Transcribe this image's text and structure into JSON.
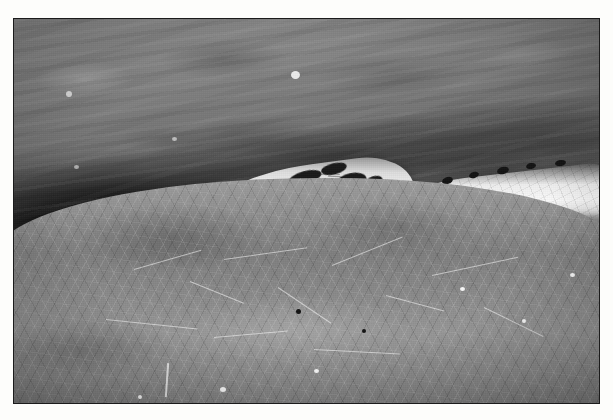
{
  "page": {
    "kind": "photograph",
    "medium": "black-and-white print",
    "background_color": "#ffffff"
  },
  "photo": {
    "title": "Snake head emerging from water",
    "subject": "snake",
    "description": "Close-up black-and-white photograph of a snake's head resting at the surface of water, with algae mat in the foreground",
    "orientation": "landscape",
    "border_color": "#1b1b1b",
    "frame": {
      "left": 13,
      "top": 18,
      "width": 587,
      "height": 386
    },
    "tone_range": {
      "darkest": "#0d0d0d",
      "lightest": "#f7f7f7"
    }
  },
  "scene": {
    "regions": [
      {
        "name": "water-surface",
        "label": "Water surface",
        "tone": "mid gray",
        "color": "#7b7b7b"
      },
      {
        "name": "dark-water",
        "label": "Deep shadow water",
        "tone": "near black",
        "color": "#141414"
      },
      {
        "name": "algae-mat",
        "label": "Algae mat foreground",
        "tone": "light gray",
        "color": "#8f8f8f"
      }
    ],
    "subject_parts": [
      {
        "name": "snake-head",
        "label": "Snake head",
        "tone": "bright",
        "color": "#f2f2f2"
      },
      {
        "name": "snake-eye",
        "label": "Eye with bright ring highlight",
        "color": "#101010"
      },
      {
        "name": "snake-nostril",
        "label": "Nostril",
        "color": "#1e1e1e"
      },
      {
        "name": "snake-tongue",
        "label": "Tongue tip",
        "color": "#ebebeb"
      },
      {
        "name": "snake-body",
        "label": "Snake body extending to right edge",
        "color": "#dcdcdc"
      },
      {
        "name": "head-markings",
        "label": "Dark dorsal blotches",
        "color": "#1d1d1d"
      }
    ]
  },
  "caption": {
    "text": ""
  }
}
